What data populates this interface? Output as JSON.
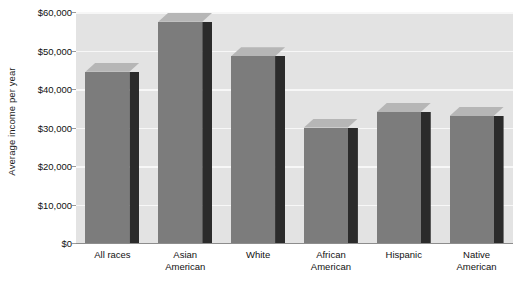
{
  "chart_data": {
    "type": "bar",
    "title": "",
    "xlabel": "",
    "ylabel": "Average income per year",
    "categories": [
      "All races",
      "Asian American",
      "White",
      "African American",
      "Hispanic",
      "Native American"
    ],
    "category_lines": [
      [
        "All races",
        ""
      ],
      [
        "Asian",
        "American"
      ],
      [
        "White",
        ""
      ],
      [
        "African",
        "American"
      ],
      [
        "Hispanic",
        ""
      ],
      [
        "Native",
        "American"
      ]
    ],
    "values": [
      44500,
      57500,
      48500,
      30000,
      34000,
      33000
    ],
    "ylim": [
      0,
      60000
    ],
    "ytick_values": [
      0,
      10000,
      20000,
      30000,
      40000,
      50000,
      60000
    ],
    "ytick_labels": [
      "$0",
      "$10,000",
      "$20,000",
      "$30,000",
      "$40,000",
      "$50,000",
      "$60,000"
    ],
    "grid": true,
    "legend": false,
    "legend_position": "none",
    "style": "3d-bar",
    "colors": {
      "bar_front": "#7c7c7c",
      "bar_side": "#2b2b2b",
      "bar_top": "#b6b6b6",
      "plot_background": "#e3e3e3",
      "gridline": "#f7f7f7",
      "axis_line": "#8d8d8d",
      "text": "#111111",
      "page_background": "#ffffff"
    }
  }
}
